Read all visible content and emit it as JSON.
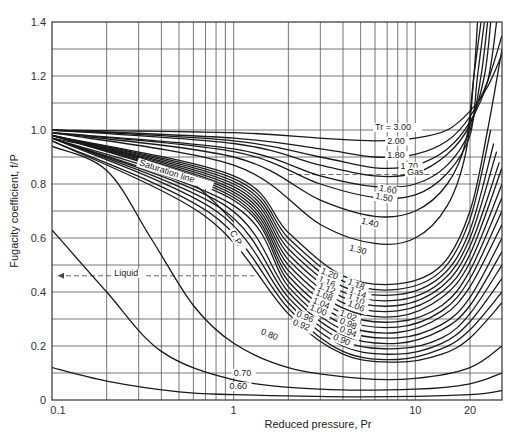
{
  "chart_data": {
    "type": "line",
    "title": "",
    "xlabel": "Reduced pressure, Pr",
    "ylabel": "Fugacity coefficient, f/P",
    "xscale": "log",
    "xlim": [
      0.1,
      30
    ],
    "ylim": [
      0,
      1.4
    ],
    "x_ticks": [
      "0.1",
      "1",
      "10",
      "20"
    ],
    "y_ticks": [
      "0",
      "0.2",
      "0.4",
      "0.6",
      "0.8",
      "1.0",
      "1.2",
      "1.4"
    ],
    "grid": true,
    "legend": null,
    "series": [
      {
        "name": "Tr = 3.00",
        "points": [
          [
            0.1,
            1.0
          ],
          [
            1,
            0.99
          ],
          [
            3,
            0.97
          ],
          [
            6,
            0.96
          ],
          [
            10,
            0.97
          ],
          [
            15,
            1.0
          ],
          [
            20,
            1.07
          ],
          [
            25,
            1.16
          ],
          [
            30,
            1.28
          ]
        ]
      },
      {
        "name": "2.00",
        "points": [
          [
            0.1,
            1.0
          ],
          [
            1,
            0.97
          ],
          [
            3,
            0.93
          ],
          [
            6,
            0.9
          ],
          [
            10,
            0.91
          ],
          [
            15,
            0.96
          ],
          [
            20,
            1.05
          ],
          [
            25,
            1.18
          ],
          [
            30,
            1.35
          ]
        ]
      },
      {
        "name": "1.80",
        "points": [
          [
            0.1,
            1.0
          ],
          [
            1,
            0.96
          ],
          [
            3,
            0.9
          ],
          [
            6,
            0.86
          ],
          [
            10,
            0.87
          ],
          [
            15,
            0.93
          ],
          [
            20,
            1.03
          ],
          [
            25,
            1.18
          ],
          [
            28,
            1.4
          ]
        ]
      },
      {
        "name": "1.70",
        "points": [
          [
            0.1,
            1.0
          ],
          [
            1,
            0.95
          ],
          [
            3,
            0.87
          ],
          [
            6,
            0.83
          ],
          [
            10,
            0.84
          ],
          [
            15,
            0.91
          ],
          [
            20,
            1.02
          ],
          [
            24,
            1.2
          ],
          [
            26,
            1.4
          ]
        ]
      },
      {
        "name": "1.60",
        "points": [
          [
            0.1,
            0.99
          ],
          [
            1,
            0.93
          ],
          [
            3,
            0.83
          ],
          [
            6,
            0.79
          ],
          [
            10,
            0.8
          ],
          [
            15,
            0.87
          ],
          [
            20,
            1.0
          ],
          [
            23,
            1.2
          ],
          [
            25,
            1.4
          ]
        ]
      },
      {
        "name": "1.50",
        "points": [
          [
            0.1,
            0.99
          ],
          [
            1,
            0.92
          ],
          [
            3,
            0.8
          ],
          [
            6,
            0.75
          ],
          [
            10,
            0.76
          ],
          [
            15,
            0.84
          ],
          [
            20,
            0.98
          ],
          [
            22,
            1.2
          ],
          [
            24,
            1.4
          ]
        ]
      },
      {
        "name": "1.40",
        "points": [
          [
            0.1,
            0.99
          ],
          [
            1,
            0.9
          ],
          [
            3,
            0.74
          ],
          [
            6,
            0.68
          ],
          [
            10,
            0.7
          ],
          [
            15,
            0.8
          ],
          [
            19,
            0.96
          ],
          [
            21,
            1.2
          ],
          [
            23,
            1.4
          ]
        ]
      },
      {
        "name": "1.30",
        "points": [
          [
            0.1,
            0.99
          ],
          [
            1,
            0.87
          ],
          [
            3,
            0.65
          ],
          [
            6,
            0.58
          ],
          [
            10,
            0.6
          ],
          [
            15,
            0.72
          ],
          [
            19,
            0.92
          ],
          [
            21,
            1.2
          ],
          [
            22,
            1.4
          ]
        ]
      },
      {
        "name": "1.20",
        "points": [
          [
            0.1,
            0.98
          ],
          [
            1,
            0.83
          ],
          [
            2,
            0.62
          ],
          [
            4,
            0.46
          ],
          [
            8,
            0.43
          ],
          [
            14,
            0.5
          ],
          [
            20,
            0.7
          ],
          [
            25,
            1.0
          ],
          [
            30,
            1.3
          ]
        ]
      },
      {
        "name": "1.18",
        "points": [
          [
            0.1,
            0.98
          ],
          [
            1,
            0.82
          ],
          [
            2,
            0.6
          ],
          [
            4,
            0.44
          ],
          [
            8,
            0.41
          ],
          [
            14,
            0.48
          ],
          [
            20,
            0.67
          ],
          [
            26,
            1.0
          ]
        ]
      },
      {
        "name": "1.16",
        "points": [
          [
            0.1,
            0.98
          ],
          [
            1,
            0.81
          ],
          [
            2,
            0.58
          ],
          [
            4,
            0.42
          ],
          [
            8,
            0.39
          ],
          [
            14,
            0.46
          ],
          [
            20,
            0.63
          ],
          [
            27,
            0.95
          ]
        ]
      },
      {
        "name": "1.14",
        "points": [
          [
            0.1,
            0.98
          ],
          [
            1,
            0.8
          ],
          [
            2,
            0.56
          ],
          [
            4,
            0.4
          ],
          [
            8,
            0.37
          ],
          [
            14,
            0.44
          ],
          [
            20,
            0.6
          ],
          [
            28,
            0.92
          ]
        ]
      },
      {
        "name": "1.12",
        "points": [
          [
            0.1,
            0.98
          ],
          [
            1,
            0.79
          ],
          [
            2,
            0.54
          ],
          [
            4,
            0.38
          ],
          [
            8,
            0.35
          ],
          [
            14,
            0.42
          ],
          [
            20,
            0.57
          ],
          [
            29,
            0.88
          ]
        ]
      },
      {
        "name": "1.10",
        "points": [
          [
            0.1,
            0.98
          ],
          [
            1,
            0.78
          ],
          [
            2,
            0.52
          ],
          [
            4,
            0.36
          ],
          [
            8,
            0.33
          ],
          [
            14,
            0.4
          ],
          [
            20,
            0.54
          ],
          [
            30,
            0.86
          ]
        ]
      },
      {
        "name": "1.08",
        "points": [
          [
            0.1,
            0.98
          ],
          [
            1,
            0.77
          ],
          [
            2,
            0.5
          ],
          [
            4,
            0.34
          ],
          [
            8,
            0.31
          ],
          [
            14,
            0.38
          ],
          [
            20,
            0.51
          ],
          [
            30,
            0.8
          ]
        ]
      },
      {
        "name": "1.06",
        "points": [
          [
            0.1,
            0.98
          ],
          [
            1,
            0.76
          ],
          [
            2,
            0.48
          ],
          [
            4,
            0.32
          ],
          [
            8,
            0.29
          ],
          [
            14,
            0.35
          ],
          [
            20,
            0.48
          ],
          [
            30,
            0.75
          ]
        ]
      },
      {
        "name": "1.04",
        "points": [
          [
            0.1,
            0.98
          ],
          [
            1,
            0.75
          ],
          [
            2,
            0.46
          ],
          [
            4,
            0.3
          ],
          [
            8,
            0.27
          ],
          [
            14,
            0.33
          ],
          [
            20,
            0.45
          ],
          [
            30,
            0.7
          ]
        ]
      },
      {
        "name": "1.02",
        "points": [
          [
            0.1,
            0.97
          ],
          [
            1,
            0.74
          ],
          [
            2,
            0.44
          ],
          [
            4,
            0.28
          ],
          [
            8,
            0.25
          ],
          [
            14,
            0.31
          ],
          [
            20,
            0.42
          ],
          [
            30,
            0.65
          ]
        ]
      },
      {
        "name": "1.00",
        "points": [
          [
            0.1,
            0.97
          ],
          [
            1,
            0.72
          ],
          [
            2,
            0.42
          ],
          [
            4,
            0.26
          ],
          [
            8,
            0.23
          ],
          [
            14,
            0.28
          ],
          [
            20,
            0.38
          ],
          [
            30,
            0.6
          ]
        ]
      },
      {
        "name": "0.98",
        "points": [
          [
            0.1,
            0.97
          ],
          [
            0.9,
            0.72
          ],
          [
            2,
            0.4
          ],
          [
            4,
            0.24
          ],
          [
            8,
            0.21
          ],
          [
            14,
            0.26
          ],
          [
            20,
            0.35
          ],
          [
            30,
            0.55
          ]
        ]
      },
      {
        "name": "0.96",
        "points": [
          [
            0.1,
            0.97
          ],
          [
            0.85,
            0.71
          ],
          [
            2,
            0.38
          ],
          [
            4,
            0.22
          ],
          [
            8,
            0.19
          ],
          [
            14,
            0.23
          ],
          [
            20,
            0.32
          ],
          [
            30,
            0.5
          ]
        ]
      },
      {
        "name": "0.94",
        "points": [
          [
            0.1,
            0.97
          ],
          [
            0.8,
            0.7
          ],
          [
            2,
            0.36
          ],
          [
            4,
            0.2
          ],
          [
            8,
            0.17
          ],
          [
            14,
            0.21
          ],
          [
            20,
            0.29
          ],
          [
            30,
            0.45
          ]
        ]
      },
      {
        "name": "0.92",
        "points": [
          [
            0.1,
            0.96
          ],
          [
            0.75,
            0.69
          ],
          [
            2,
            0.34
          ],
          [
            4,
            0.18
          ],
          [
            8,
            0.15
          ],
          [
            14,
            0.19
          ],
          [
            20,
            0.26
          ],
          [
            30,
            0.4
          ]
        ]
      },
      {
        "name": "0.90",
        "points": [
          [
            0.1,
            0.96
          ],
          [
            0.7,
            0.68
          ],
          [
            2,
            0.32
          ],
          [
            4,
            0.17
          ],
          [
            8,
            0.14
          ],
          [
            14,
            0.17
          ],
          [
            20,
            0.23
          ],
          [
            30,
            0.36
          ]
        ]
      },
      {
        "name": "0.80",
        "points": [
          [
            0.1,
            0.94
          ],
          [
            0.2,
            0.85
          ],
          [
            0.35,
            0.6
          ],
          [
            0.6,
            0.35
          ],
          [
            1,
            0.21
          ],
          [
            2,
            0.12
          ],
          [
            5,
            0.08
          ],
          [
            10,
            0.08
          ],
          [
            20,
            0.12
          ],
          [
            30,
            0.2
          ]
        ]
      },
      {
        "name": "0.70",
        "points": [
          [
            0.1,
            0.63
          ],
          [
            0.2,
            0.4
          ],
          [
            0.4,
            0.18
          ],
          [
            1,
            0.075
          ],
          [
            3,
            0.04
          ],
          [
            10,
            0.04
          ],
          [
            20,
            0.06
          ],
          [
            30,
            0.1
          ]
        ]
      },
      {
        "name": "0.60",
        "points": [
          [
            0.1,
            0.12
          ],
          [
            0.2,
            0.07
          ],
          [
            0.5,
            0.03
          ],
          [
            1,
            0.02
          ],
          [
            5,
            0.012
          ],
          [
            20,
            0.02
          ],
          [
            30,
            0.035
          ]
        ]
      }
    ],
    "annotations": [
      {
        "text": "Tr = 3.00",
        "x": 6.0,
        "y": 1.0
      },
      {
        "text": "2.00",
        "x": 7.0,
        "y": 0.95
      },
      {
        "text": "1.80",
        "x": 7.0,
        "y": 0.895
      },
      {
        "text": "1.70",
        "x": 8.3,
        "y": 0.855
      },
      {
        "text": "1.60",
        "x": 6.3,
        "y": 0.775
      },
      {
        "text": "1.50",
        "x": 6.0,
        "y": 0.745
      },
      {
        "text": "1.40",
        "x": 5.0,
        "y": 0.655
      },
      {
        "text": "1.30",
        "x": 4.3,
        "y": 0.555
      },
      {
        "text": "1.20",
        "x": 3.0,
        "y": 0.47
      },
      {
        "text": "1.18",
        "x": 4.2,
        "y": 0.43
      },
      {
        "text": "1.16",
        "x": 2.9,
        "y": 0.44
      },
      {
        "text": "1.14",
        "x": 4.3,
        "y": 0.4
      },
      {
        "text": "1.12",
        "x": 2.9,
        "y": 0.415
      },
      {
        "text": "1.10",
        "x": 4.2,
        "y": 0.375
      },
      {
        "text": "1.08",
        "x": 2.8,
        "y": 0.39
      },
      {
        "text": "1.06",
        "x": 4.2,
        "y": 0.35
      },
      {
        "text": "1.04",
        "x": 2.7,
        "y": 0.36
      },
      {
        "text": "1.02",
        "x": 3.8,
        "y": 0.315
      },
      {
        "text": "1.00",
        "x": 2.6,
        "y": 0.335
      },
      {
        "text": "0.98",
        "x": 3.8,
        "y": 0.285
      },
      {
        "text": "0.96",
        "x": 2.2,
        "y": 0.31
      },
      {
        "text": "0.94",
        "x": 3.8,
        "y": 0.255
      },
      {
        "text": "0.92",
        "x": 2.1,
        "y": 0.28
      },
      {
        "text": "0.90",
        "x": 3.5,
        "y": 0.225
      },
      {
        "text": "0.80",
        "x": 1.4,
        "y": 0.245
      },
      {
        "text": "0.70",
        "x": 1.0,
        "y": 0.09
      },
      {
        "text": "0.60",
        "x": 0.95,
        "y": 0.04
      },
      {
        "text": "Gas",
        "x": 9.0,
        "y": 0.835
      },
      {
        "text": "Liquid",
        "x": 0.22,
        "y": 0.46
      },
      {
        "text": "Saturation line",
        "x": 0.3,
        "y": 0.87
      },
      {
        "text": "C.P.",
        "x": 0.95,
        "y": 0.62
      }
    ],
    "saturation_line": [
      [
        0.1,
        0.97
      ],
      [
        0.3,
        0.9
      ],
      [
        0.6,
        0.8
      ],
      [
        1,
        0.66
      ]
    ],
    "liquid_dashed_y": 0.46,
    "gas_dashed_y": 0.835
  }
}
